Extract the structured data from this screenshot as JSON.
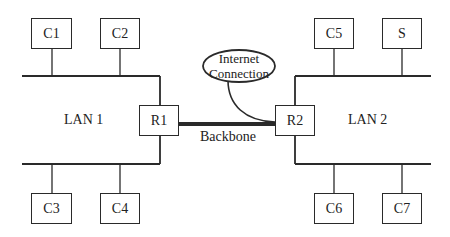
{
  "diagram": {
    "lans": [
      {
        "label": "LAN 1"
      },
      {
        "label": "LAN 2"
      }
    ],
    "routers": [
      {
        "label": "R1"
      },
      {
        "label": "R2"
      }
    ],
    "nodes": {
      "c1": "C1",
      "c2": "C2",
      "c3": "C3",
      "c4": "C4",
      "c5": "C5",
      "s": "S",
      "c6": "C6",
      "c7": "C7"
    },
    "backbone_label": "Backbone",
    "internet": {
      "line1": "Internet",
      "line2": "Connection"
    },
    "edges": [
      [
        "C1",
        "LAN 1 top bus"
      ],
      [
        "C2",
        "LAN 1 top bus"
      ],
      [
        "LAN 1 top bus",
        "R1"
      ],
      [
        "R1",
        "LAN 1 bottom bus"
      ],
      [
        "C3",
        "LAN 1 bottom bus"
      ],
      [
        "C4",
        "LAN 1 bottom bus"
      ],
      [
        "C5",
        "LAN 2 top bus"
      ],
      [
        "S",
        "LAN 2 top bus"
      ],
      [
        "LAN 2 top bus",
        "R2"
      ],
      [
        "R2",
        "LAN 2 bottom bus"
      ],
      [
        "C6",
        "LAN 2 bottom bus"
      ],
      [
        "C7",
        "LAN 2 bottom bus"
      ],
      [
        "R1",
        "R2",
        "Backbone"
      ],
      [
        "Internet Connection",
        "R2"
      ]
    ],
    "colors": {
      "line": "#2a2a2a",
      "background": "#ffffff"
    }
  }
}
